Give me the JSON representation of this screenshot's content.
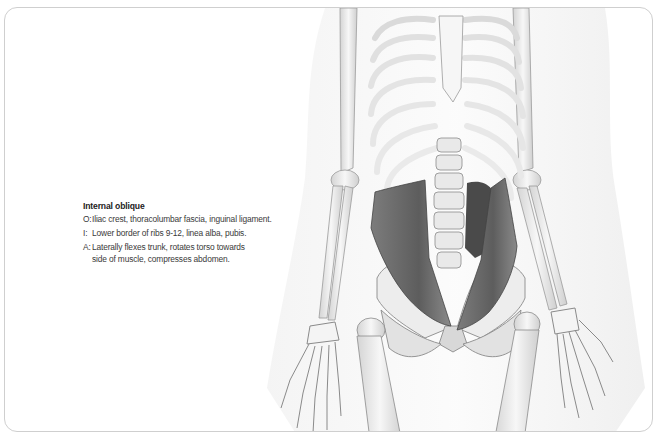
{
  "caption": {
    "title": "Internal oblique",
    "entries": [
      {
        "key": "O:",
        "lines": [
          "Iliac crest, thoracolumbar fascia, inguinal ligament."
        ]
      },
      {
        "key": "I:",
        "lines": [
          "Lower border of ribs 9-12, linea alba, pubis."
        ]
      },
      {
        "key": "A:",
        "lines": [
          "Laterally flexes trunk, rotates torso towards",
          "side of muscle, compresses abdomen."
        ]
      }
    ]
  },
  "illustration": {
    "subject": "anterior skeleton of torso, arms and pelvis with internal oblique muscles highlighted",
    "colors": {
      "bone": "#f2f2f2",
      "bone_shadow": "#bdbdbd",
      "outline": "#8a8a8a",
      "muscle": "#6d6d6d",
      "muscle_dark": "#4a4a4a",
      "body_silhouette": "#ececec",
      "frame_border": "#cfcfcf"
    }
  }
}
